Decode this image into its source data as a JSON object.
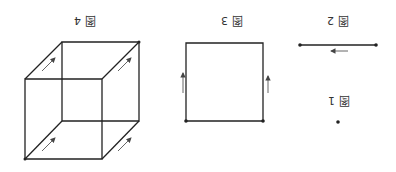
{
  "figures": [
    {
      "id": "fig1",
      "label": "图 1",
      "description": "a single point"
    },
    {
      "id": "fig2",
      "label": "图 2",
      "description": "a line segment with arrow"
    },
    {
      "id": "fig3",
      "label": "图 3",
      "description": "a square swept from a segment, arrows on sides"
    },
    {
      "id": "fig4",
      "label": "图 4",
      "description": "a cube swept from a square, arrows on receding edges"
    }
  ],
  "orientation": "rotated 180 degrees",
  "colors": {
    "stroke": "#222222",
    "arrow": "#555555",
    "text": "#333333"
  }
}
